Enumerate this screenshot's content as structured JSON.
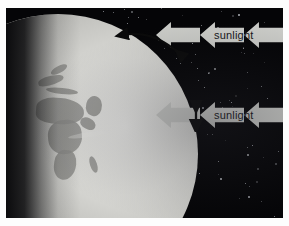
{
  "figure": {
    "background_color": "#050507",
    "frame_color": "#fdfdfd"
  },
  "earth": {
    "name": "earth-globe",
    "lit_side": "right",
    "dark_side": "left",
    "surface_color": "#d8d8d4",
    "land_color": "#8f8f8c",
    "night_color": "#050507"
  },
  "sunlight_bands": [
    {
      "id": "upper-band",
      "label": "sunlight",
      "direction": "left",
      "arrow_color": "#c9cac6",
      "text_color": "#16161a",
      "arrow_count": 3,
      "top": 22,
      "height": 26
    },
    {
      "id": "lower-band",
      "label": "sunlight",
      "direction": "left",
      "arrow_color": "#c9cac6",
      "text_color": "#16161a",
      "arrow_count": 3,
      "top": 102,
      "height": 26
    }
  ],
  "annotations": [
    {
      "id": "polar-arc-arrow",
      "name": "curved-double-arrow",
      "style": "curved double-headed arrow",
      "color": "#0a0a0a",
      "meaning": "spread of the beam across the curved surface near the pole"
    },
    {
      "id": "beam-width-arrow",
      "name": "vertical-double-arrow",
      "style": "straight vertical double-headed arrow",
      "color": "#0a0a0a",
      "meaning": "width of the incoming sunlight beam at the equator"
    }
  ],
  "stars": {
    "color": "#cfd2d8",
    "count": 150
  }
}
